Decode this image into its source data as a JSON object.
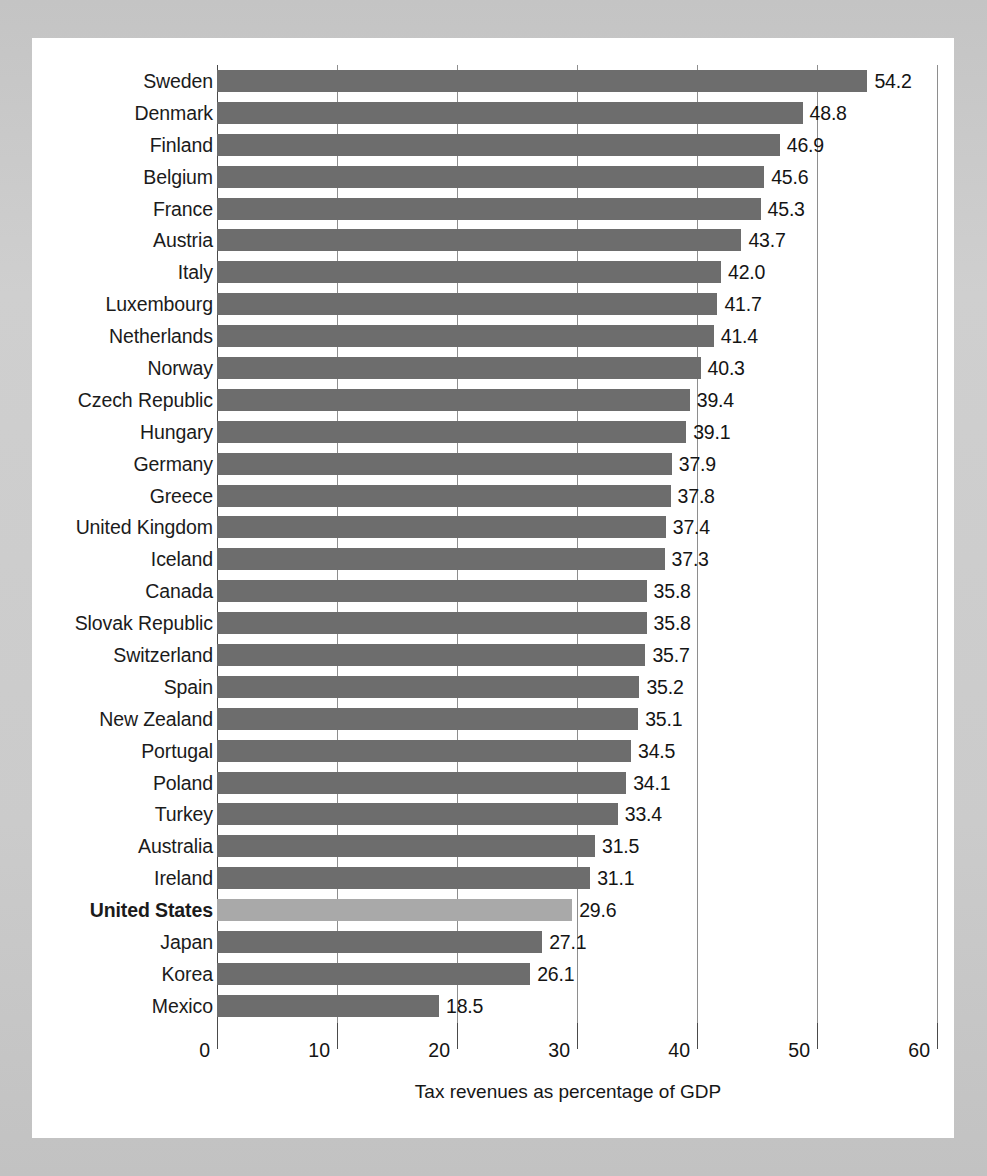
{
  "figure": {
    "axis_title": "Tax revenues as percentage of GDP",
    "highlight_country": "United States",
    "bar_color": "#6d6d6d",
    "highlight_bar_color": "#a9a9a9",
    "panel_background": "#ffffff",
    "surround_background": "#c9c9c9",
    "axis_color": "#4a4a4a",
    "gridline_color": "#8e8e8e"
  },
  "chart_data": {
    "type": "bar",
    "orientation": "horizontal",
    "title": "",
    "subtitle": "",
    "xlabel": "Tax revenues as percentage of GDP",
    "ylabel": "",
    "xlim": [
      0,
      60
    ],
    "xticks": [
      0,
      10,
      20,
      30,
      40,
      50,
      60
    ],
    "xtick_labels": [
      "0",
      "10",
      "20",
      "30",
      "40",
      "50",
      "60"
    ],
    "grid": true,
    "grid_axis": "x",
    "legend": false,
    "legend_position": "none",
    "value_labels": true,
    "highlighted_categories": [
      "United States"
    ],
    "categories": [
      "Sweden",
      "Denmark",
      "Finland",
      "Belgium",
      "France",
      "Austria",
      "Italy",
      "Luxembourg",
      "Netherlands",
      "Norway",
      "Czech Republic",
      "Hungary",
      "Germany",
      "Greece",
      "United Kingdom",
      "Iceland",
      "Canada",
      "Slovak Republic",
      "Switzerland",
      "Spain",
      "New Zealand",
      "Portugal",
      "Poland",
      "Turkey",
      "Australia",
      "Ireland",
      "United States",
      "Japan",
      "Korea",
      "Mexico"
    ],
    "values": [
      54.2,
      48.8,
      46.9,
      45.6,
      45.3,
      43.7,
      42.0,
      41.7,
      41.4,
      40.3,
      39.4,
      39.1,
      37.9,
      37.8,
      37.4,
      37.3,
      35.8,
      35.8,
      35.7,
      35.2,
      35.1,
      34.5,
      34.1,
      33.4,
      31.5,
      31.1,
      29.6,
      27.1,
      26.1,
      18.5
    ],
    "value_label_texts": [
      "54.2",
      "48.8",
      "46.9",
      "45.6",
      "45.3",
      "43.7",
      "42.0",
      "41.7",
      "41.4",
      "40.3",
      "39.4",
      "39.1",
      "37.9",
      "37.8",
      "37.4",
      "37.3",
      "35.8",
      "35.8",
      "35.7",
      "35.2",
      "35.1",
      "34.5",
      "34.1",
      "33.4",
      "31.5",
      "31.1",
      "29.6",
      "27.1",
      "26.1",
      "18.5"
    ]
  }
}
